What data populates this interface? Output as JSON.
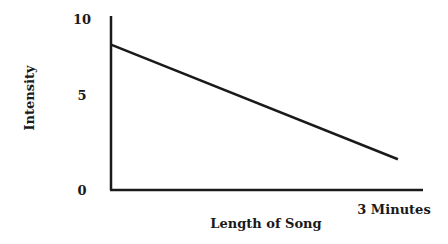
{
  "chart_data": {
    "type": "line",
    "title": "",
    "xlabel": "Length of Song",
    "ylabel": "Intensity",
    "x_tick_labels": [
      "3 Minutes"
    ],
    "y_ticks": [
      0,
      5,
      10
    ],
    "y_tick_labels": [
      "10",
      "5",
      "0"
    ],
    "ylim": [
      0,
      10
    ],
    "xlim": [
      0,
      3
    ],
    "grid": false,
    "legend": "none",
    "series": [
      {
        "name": "Intensity",
        "x": [
          0,
          2.85
        ],
        "y": [
          8.5,
          1.8
        ]
      }
    ]
  }
}
